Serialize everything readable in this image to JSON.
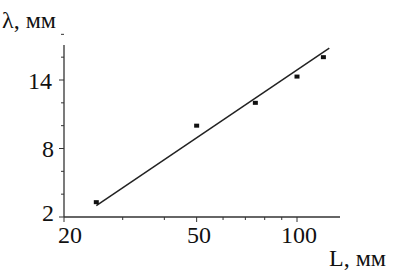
{
  "chart_data": {
    "type": "scatter",
    "title": "",
    "xlabel": "L, мм",
    "ylabel": "λ, мм",
    "xscale": "log",
    "xlim": [
      20,
      130
    ],
    "ylim": [
      2,
      18
    ],
    "x_ticks": [
      "20",
      "50",
      "100"
    ],
    "y_ticks": [
      "2",
      "8",
      "14"
    ],
    "grid": false,
    "legend": null,
    "series": [
      {
        "name": "measured",
        "type": "scatter",
        "x": [
          25,
          50,
          75,
          100,
          120
        ],
        "y": [
          3.3,
          10.0,
          12.0,
          14.3,
          16.0
        ]
      },
      {
        "name": "fit",
        "type": "line",
        "x": [
          25,
          125
        ],
        "y": [
          3.0,
          16.8
        ]
      }
    ]
  },
  "labels": {
    "ylabel": "λ, мм",
    "xlabel": "L, мм",
    "y14": "14",
    "y8": "8",
    "y2": "2",
    "x20": "20",
    "x50": "50",
    "x100": "100"
  }
}
